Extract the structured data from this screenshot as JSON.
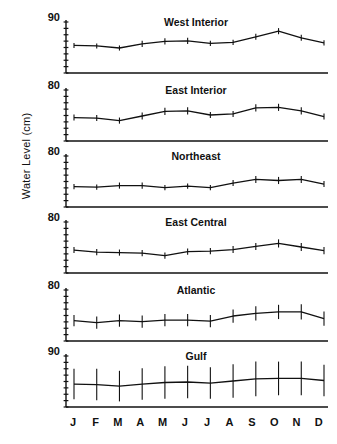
{
  "figure": {
    "ylabel": "Water Level (cm)",
    "months": [
      "J",
      "F",
      "M",
      "A",
      "M",
      "J",
      "J",
      "A",
      "S",
      "O",
      "N",
      "D"
    ],
    "line_color": "#111111",
    "axis_color": "#111111"
  },
  "chart_data": {
    "type": "line",
    "title": "",
    "xlabel": "",
    "ylabel": "Water Level (cm)",
    "x": [
      "J",
      "F",
      "M",
      "A",
      "M",
      "J",
      "J",
      "A",
      "S",
      "O",
      "N",
      "D"
    ],
    "grid": false,
    "legend": "none",
    "note": "Six stacked panels of monthly mean water level with error bars; only the top tick of each panel y-axis is labelled.",
    "panels": [
      {
        "name": "West Interior",
        "ytop_label": "90",
        "ylim": [
          80,
          90
        ],
        "values": [
          85.4,
          85.3,
          84.9,
          85.7,
          86.2,
          86.3,
          85.8,
          86.0,
          87.1,
          88.2,
          86.9,
          85.9
        ],
        "errors": [
          0.5,
          0.5,
          0.5,
          0.6,
          0.6,
          0.6,
          0.5,
          0.5,
          0.6,
          0.6,
          0.6,
          0.5
        ]
      },
      {
        "name": "East Interior",
        "ytop_label": "80",
        "ylim": [
          70,
          80
        ],
        "values": [
          74.6,
          74.5,
          74.0,
          74.9,
          75.8,
          75.9,
          75.1,
          75.3,
          76.5,
          76.6,
          75.9,
          74.8
        ],
        "errors": [
          0.6,
          0.6,
          0.6,
          0.7,
          0.7,
          0.7,
          0.6,
          0.6,
          0.7,
          0.7,
          0.7,
          0.6
        ]
      },
      {
        "name": "Northeast",
        "ytop_label": "80",
        "ylim": [
          70,
          80
        ],
        "values": [
          74.0,
          73.9,
          74.2,
          74.2,
          73.8,
          74.1,
          73.8,
          74.7,
          75.4,
          75.2,
          75.4,
          74.5
        ],
        "errors": [
          0.5,
          0.5,
          0.6,
          0.6,
          0.5,
          0.5,
          0.5,
          0.6,
          0.7,
          0.7,
          0.7,
          0.6
        ]
      },
      {
        "name": "East Central",
        "ytop_label": "80",
        "ylim": [
          70,
          80
        ],
        "values": [
          74.5,
          74.1,
          74.0,
          73.9,
          73.4,
          74.2,
          74.3,
          74.6,
          75.2,
          75.8,
          75.1,
          74.4
        ],
        "errors": [
          0.6,
          0.6,
          0.6,
          0.6,
          0.6,
          0.6,
          0.6,
          0.7,
          0.7,
          0.8,
          0.8,
          0.7
        ]
      },
      {
        "name": "Atlantic",
        "ytop_label": "80",
        "ylim": [
          70,
          80
        ],
        "values": [
          74.0,
          73.6,
          74.0,
          73.8,
          74.1,
          74.1,
          73.9,
          74.9,
          75.4,
          75.7,
          75.7,
          74.4
        ],
        "errors": [
          1.1,
          1.2,
          1.2,
          1.2,
          1.2,
          1.2,
          1.2,
          1.3,
          1.4,
          1.4,
          1.5,
          1.4
        ]
      },
      {
        "name": "Gulf",
        "ytop_label": "90",
        "ylim": [
          80,
          90
        ],
        "values": [
          84.5,
          84.4,
          84.1,
          84.5,
          84.8,
          84.9,
          84.7,
          85.1,
          85.5,
          85.6,
          85.6,
          85.2
        ],
        "errors": [
          3.0,
          3.1,
          3.0,
          3.1,
          3.2,
          3.2,
          3.1,
          3.3,
          3.4,
          3.3,
          3.3,
          3.1
        ]
      }
    ]
  }
}
